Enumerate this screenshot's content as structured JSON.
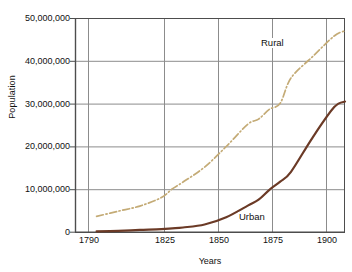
{
  "chart_data": {
    "type": "line",
    "title": "",
    "subtitle": "",
    "xlabel": "Years",
    "ylabel": "Population",
    "xlim": [
      1780,
      1905
    ],
    "ylim": [
      0,
      50000000
    ],
    "grid": true,
    "legend_position": "inline-annotations",
    "xtick_labels": [
      "1790",
      "1825",
      "1850",
      "1875",
      "1900"
    ],
    "xtick_values": [
      1790,
      1825,
      1850,
      1875,
      1900
    ],
    "ytick_labels": [
      "0",
      "10,000,000",
      "20,000,000",
      "30,000,000",
      "40,000,000",
      "50,000,000"
    ],
    "ytick_values": [
      0,
      10000000,
      20000000,
      30000000,
      40000000,
      50000000
    ],
    "x": [
      1790,
      1800,
      1810,
      1820,
      1825,
      1830,
      1840,
      1850,
      1860,
      1865,
      1870,
      1875,
      1880,
      1890,
      1900,
      1905
    ],
    "series": [
      {
        "name": "Rural",
        "color": "#c4ab76",
        "style": "dash-dot",
        "values": [
          3700000,
          4900000,
          6100000,
          8100000,
          10100000,
          11700000,
          15200000,
          20000000,
          25200000,
          26400000,
          28700000,
          30100000,
          36000000,
          41000000,
          45800000,
          47000000
        ]
      },
      {
        "name": "Urban",
        "color": "#6b3a26",
        "style": "solid",
        "values": [
          200000,
          320000,
          520000,
          700000,
          900000,
          1100000,
          1800000,
          3500000,
          6200000,
          7600000,
          9900000,
          11800000,
          14100000,
          22100000,
          29200000,
          30500000
        ]
      }
    ],
    "annotations": [
      {
        "text": "Rural",
        "x": 1885,
        "y": 42000000
      },
      {
        "text": "Urban",
        "x": 1878,
        "y": 3200000
      }
    ],
    "colors": {
      "background": "#ffffff",
      "grid": "#8c8c8c",
      "frame": "#4d4d4d",
      "text": "#111111",
      "rural": "#c4ab76",
      "urban": "#6b3a26"
    }
  }
}
